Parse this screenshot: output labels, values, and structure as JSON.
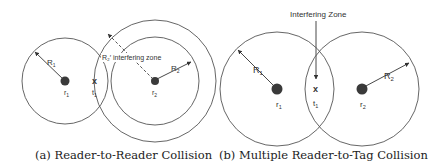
{
  "panel_a": {
    "caption": "(a) Reader-to-Reader Collision",
    "reader1": {
      "node_label": "r",
      "node_sub": "1",
      "radius_label": "R",
      "radius_sub": "1"
    },
    "reader2": {
      "node_label": "r",
      "node_sub": "2",
      "radius_label": "R",
      "radius_sub": "2"
    },
    "tag": {
      "marker": "x",
      "label": "t",
      "sub": "1"
    },
    "interfering_label": "R₂′ interfering zone"
  },
  "panel_b": {
    "caption": "(b) Multiple Reader-to-Tag Collision",
    "title": "Interfering Zone",
    "reader1": {
      "node_label": "r",
      "node_sub": "1",
      "radius_label": "R",
      "radius_sub": "1"
    },
    "reader2": {
      "node_label": "r",
      "node_sub": "2",
      "radius_label": "R",
      "radius_sub": "2"
    },
    "tag": {
      "marker": "x",
      "label": "t",
      "sub": "1"
    }
  }
}
